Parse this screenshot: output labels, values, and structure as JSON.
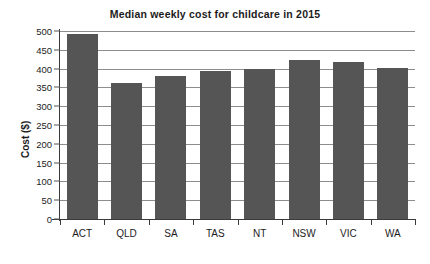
{
  "chart_data": {
    "type": "bar",
    "title": "Median weekly cost for childcare in 2015",
    "xlabel": "",
    "ylabel": "Cost ($)",
    "categories": [
      "ACT",
      "QLD",
      "SA",
      "TAS",
      "NT",
      "NSW",
      "VIC",
      "WA"
    ],
    "values": [
      492,
      362,
      381,
      394,
      398,
      422,
      417,
      402
    ],
    "ylim": [
      0,
      500
    ],
    "ytick_values": [
      0,
      50,
      100,
      150,
      200,
      250,
      300,
      350,
      400,
      450,
      500
    ],
    "ytick_labels": [
      "0",
      "50",
      "100",
      "150",
      "200",
      "250",
      "300",
      "350",
      "400",
      "450",
      "500"
    ],
    "grid": true,
    "grid_axis": "y",
    "legend": false,
    "bar_color": "#555555",
    "grid_color": "#8d8d8d",
    "axis_color": "#3a3a3a",
    "background_color": "#ffffff",
    "text_color": "#1c1c1c"
  }
}
